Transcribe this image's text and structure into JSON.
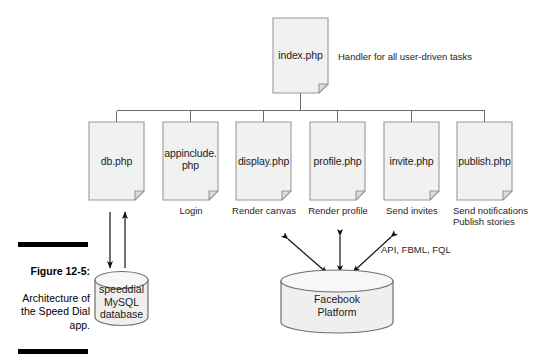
{
  "figure": {
    "caption_title": "Figure 12-5:",
    "caption_body": "Architecture of the Speed Dial app.",
    "rule_color": "#000000"
  },
  "colors": {
    "node_fill": "#f1f1f1",
    "node_stroke": "#9a9a9a",
    "cylinder_fill": "#efefef",
    "cylinder_stroke": "#6e6e6e",
    "line": "#6b6b6b",
    "arrow": "#111111",
    "text": "#1b1b1b"
  },
  "root": {
    "name": "index-php",
    "label": "index.php",
    "note": "Handler for all user-driven tasks"
  },
  "children": [
    {
      "name": "db-php",
      "label": "db.php",
      "note": ""
    },
    {
      "name": "appinclude-php",
      "label": "appinclude.\nphp",
      "note": "Login"
    },
    {
      "name": "display-php",
      "label": "display.php",
      "note": "Render canvas"
    },
    {
      "name": "profile-php",
      "label": "profile.php",
      "note": "Render profile"
    },
    {
      "name": "invite-php",
      "label": "invite.php",
      "note": "Send invites"
    },
    {
      "name": "publish-php",
      "label": "publish.php",
      "note": "Send notifications\nPublish stories"
    }
  ],
  "datastores": [
    {
      "name": "mysql-database",
      "label": "speeddial\nMySQL\ndatabase"
    },
    {
      "name": "facebook-platform",
      "label": "Facebook\nPlatform"
    }
  ],
  "annotations": [
    {
      "name": "api-protocols-label",
      "text": "API, FBML, FQL"
    }
  ]
}
